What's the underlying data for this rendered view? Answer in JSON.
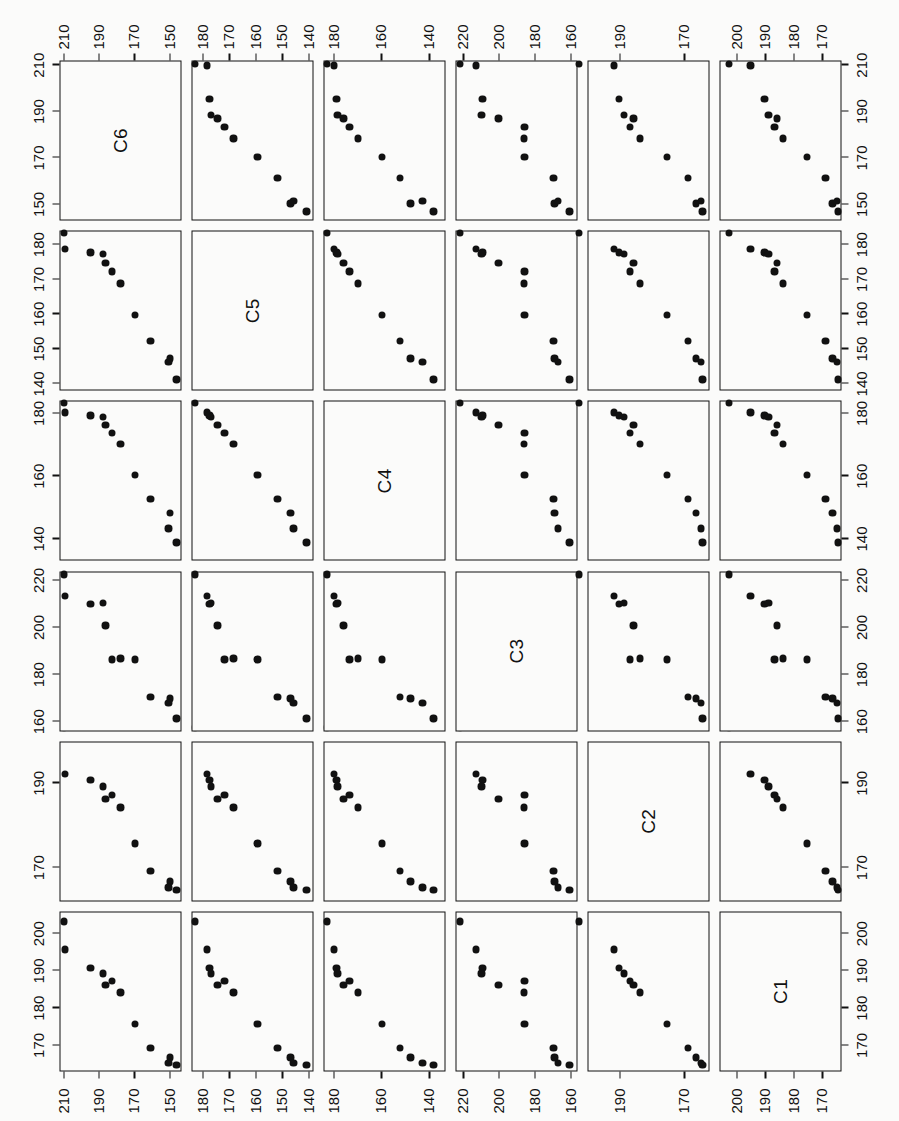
{
  "figure": {
    "type": "scatterplot-matrix",
    "orientation_note": "rotated-90-ccw",
    "background_color": "#fbfbfa",
    "point_color": "#111111",
    "frame_color": "#111111"
  },
  "chart_data": {
    "type": "scatter",
    "title": "",
    "subtitle": "",
    "xlabel": "",
    "ylabel": "",
    "grid": false,
    "legend": null,
    "matrix": true,
    "variables": [
      "C1",
      "C2",
      "C3",
      "C4",
      "C5",
      "C6"
    ],
    "diagonal_labels": [
      "C1",
      "C2",
      "C3",
      "C4",
      "C5",
      "C6"
    ],
    "axes": [
      {
        "var": "C1",
        "ticks": [
          170,
          180,
          190,
          200
        ],
        "labeled_ticks": [
          170,
          180,
          190,
          200
        ],
        "range": [
          163,
          206
        ]
      },
      {
        "var": "C2",
        "ticks": [
          170,
          190
        ],
        "labeled_ticks": [
          170,
          190
        ],
        "range": [
          162,
          200
        ]
      },
      {
        "var": "C3",
        "ticks": [
          160,
          180,
          200,
          220
        ],
        "labeled_ticks": [
          160,
          180,
          200,
          220
        ],
        "range": [
          156,
          224
        ]
      },
      {
        "var": "C4",
        "ticks": [
          140,
          160,
          180
        ],
        "labeled_ticks": [
          140,
          160,
          180
        ],
        "range": [
          133,
          184
        ]
      },
      {
        "var": "C5",
        "ticks": [
          140,
          150,
          160,
          170,
          180
        ],
        "labeled_ticks": [
          140,
          150,
          160,
          170,
          180
        ],
        "range": [
          138,
          184
        ]
      },
      {
        "var": "C6",
        "ticks": [
          150,
          170,
          190,
          210
        ],
        "labeled_ticks": [
          150,
          170,
          190,
          210
        ],
        "range": [
          143,
          212
        ]
      }
    ],
    "n_points": 12,
    "observations": [
      {
        "C1": 203.0,
        "C2": 203.0,
        "C3": 222.0,
        "C4": 183.0,
        "C5": 183.0,
        "C6": 210.0
      },
      {
        "C1": 195.5,
        "C2": 192.0,
        "C3": 213.0,
        "C4": 180.0,
        "C5": 178.5,
        "C6": 209.5
      },
      {
        "C1": 190.5,
        "C2": 190.5,
        "C3": 209.5,
        "C4": 179.0,
        "C5": 177.5,
        "C6": 195.0
      },
      {
        "C1": 189.0,
        "C2": 189.0,
        "C3": 210.0,
        "C4": 178.5,
        "C5": 177.0,
        "C6": 188.0
      },
      {
        "C1": 186.0,
        "C2": 186.0,
        "C3": 200.5,
        "C4": 176.0,
        "C5": 174.5,
        "C6": 186.5
      },
      {
        "C1": 187.0,
        "C2": 187.0,
        "C3": 186.0,
        "C4": 173.5,
        "C5": 172.0,
        "C6": 183.0
      },
      {
        "C1": 184.0,
        "C2": 184.0,
        "C3": 186.5,
        "C4": 170.0,
        "C5": 168.5,
        "C6": 178.0
      },
      {
        "C1": 175.5,
        "C2": 175.5,
        "C3": 186.0,
        "C4": 160.0,
        "C5": 159.5,
        "C6": 170.0
      },
      {
        "C1": 169.0,
        "C2": 169.0,
        "C3": 170.0,
        "C4": 152.5,
        "C5": 152.0,
        "C6": 161.0
      },
      {
        "C1": 166.5,
        "C2": 166.5,
        "C3": 169.5,
        "C4": 148.0,
        "C5": 147.0,
        "C6": 150.0
      },
      {
        "C1": 165.0,
        "C2": 165.0,
        "C3": 167.5,
        "C4": 143.0,
        "C5": 146.0,
        "C6": 151.0
      },
      {
        "C1": 164.5,
        "C2": 164.5,
        "C3": 161.0,
        "C4": 138.5,
        "C5": 141.0,
        "C6": 146.5
      }
    ]
  }
}
